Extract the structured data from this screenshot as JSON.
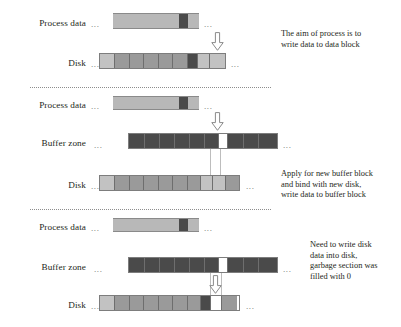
{
  "diagram": {
    "colors": {
      "background": "#ffffff",
      "text": "#231f20",
      "light_block": "#c2c2c2",
      "mid_block": "#9a9a9a",
      "dark_block": "#4a4a4a",
      "empty_block": "#ffffff",
      "outline": "#7d7d7d",
      "separator": "#8d8d8d"
    },
    "ellipsis": "...",
    "sections": [
      {
        "id": "stage-1",
        "note": "The aim of process is to\nwrite data to data block",
        "rows": [
          {
            "id": "stage1-process-data",
            "label": "Process data",
            "type": "process",
            "segments": [
              "light",
              "light",
              "light",
              "light",
              "light",
              "light",
              "dark",
              "light"
            ]
          },
          {
            "id": "stage1-disk",
            "label": "Disk",
            "type": "disk",
            "segments": [
              "light",
              "mid",
              "mid",
              "mid",
              "mid",
              "mid",
              "mid",
              "dark",
              "light",
              "light"
            ]
          }
        ],
        "arrow": "down-arrow-icon"
      },
      {
        "id": "stage-2",
        "note": "Apply for new buffer block\nand bind with new disk,\nwrite data to buffer block",
        "rows": [
          {
            "id": "stage2-process-data",
            "label": "Process data",
            "type": "process",
            "segments": [
              "light",
              "light",
              "light",
              "light",
              "light",
              "light",
              "dark",
              "light"
            ]
          },
          {
            "id": "stage2-buffer-zone",
            "label": "Buffer zone",
            "type": "buffer",
            "segments": [
              "dark",
              "dark",
              "dark",
              "dark",
              "dark",
              "dark",
              "dark",
              "empty",
              "dark",
              "dark",
              "dark"
            ]
          },
          {
            "id": "stage2-disk",
            "label": "Disk",
            "type": "disk",
            "segments": [
              "light",
              "mid",
              "mid",
              "mid",
              "mid",
              "mid",
              "mid",
              "light",
              "light",
              "mid"
            ]
          }
        ],
        "arrow": "down-arrow-icon"
      },
      {
        "id": "stage-3",
        "note": "Need to write disk\ndata into disk,\ngarbage section was\nfilled with 0",
        "rows": [
          {
            "id": "stage3-process-data",
            "label": "Process data",
            "type": "process",
            "segments": [
              "light",
              "light",
              "light",
              "light",
              "light",
              "light",
              "dark",
              "light"
            ]
          },
          {
            "id": "stage3-buffer-zone",
            "label": "Buffer zone",
            "type": "buffer",
            "segments": [
              "dark",
              "dark",
              "dark",
              "dark",
              "dark",
              "dark",
              "dark",
              "empty",
              "dark",
              "dark",
              "dark"
            ]
          },
          {
            "id": "stage3-disk",
            "label": "Disk",
            "type": "disk",
            "segments": [
              "light",
              "mid",
              "mid",
              "mid",
              "mid",
              "mid",
              "mid",
              "dark",
              "empty",
              "mid"
            ]
          }
        ],
        "arrow": "down-arrow-icon"
      }
    ]
  }
}
